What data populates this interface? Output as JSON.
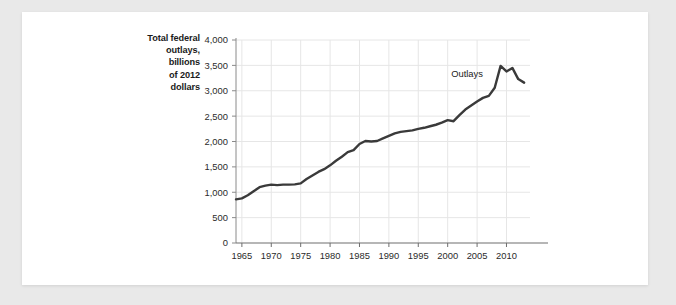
{
  "chart_data": {
    "type": "line",
    "title": "",
    "ylabel_lines": [
      "Total federal",
      "outlays,",
      "billions",
      "of 2012",
      "dollars"
    ],
    "xlabel": "",
    "ylabel": "Total federal outlays, billions of 2012 dollars",
    "xlim": [
      1964,
      2014
    ],
    "ylim": [
      0,
      4000
    ],
    "grid": true,
    "legend_position": "inline-annotation",
    "y_ticks": [
      0,
      500,
      1000,
      1500,
      2000,
      2500,
      3000,
      3500,
      4000
    ],
    "y_tick_labels": [
      "0",
      "500",
      "1,000",
      "1,500",
      "2,000",
      "2,500",
      "3,000",
      "3,500",
      "4,000"
    ],
    "x_ticks": [
      1965,
      1970,
      1975,
      1980,
      1985,
      1990,
      1995,
      2000,
      2005,
      2010
    ],
    "x_tick_labels": [
      "1965",
      "1970",
      "1975",
      "1980",
      "1985",
      "1990",
      "1995",
      "2000",
      "2005",
      "2010"
    ],
    "series": [
      {
        "name": "Outlays",
        "color": "#3a3a3a",
        "annotation": "Outlays",
        "annotation_x": 2006,
        "annotation_y": 3280,
        "x": [
          1964,
          1965,
          1966,
          1967,
          1968,
          1969,
          1970,
          1971,
          1972,
          1973,
          1974,
          1975,
          1976,
          1977,
          1978,
          1979,
          1980,
          1981,
          1982,
          1983,
          1984,
          1985,
          1986,
          1987,
          1988,
          1989,
          1990,
          1991,
          1992,
          1993,
          1994,
          1995,
          1996,
          1997,
          1998,
          1999,
          2000,
          2001,
          2002,
          2003,
          2004,
          2005,
          2006,
          2007,
          2008,
          2009,
          2010,
          2011,
          2012,
          2013
        ],
        "y": [
          860,
          880,
          940,
          1020,
          1100,
          1130,
          1150,
          1140,
          1150,
          1150,
          1155,
          1175,
          1260,
          1330,
          1400,
          1455,
          1530,
          1620,
          1700,
          1790,
          1830,
          1950,
          2010,
          2000,
          2010,
          2060,
          2110,
          2160,
          2190,
          2205,
          2220,
          2250,
          2270,
          2300,
          2330,
          2370,
          2420,
          2400,
          2520,
          2630,
          2710,
          2790,
          2860,
          2900,
          3060,
          3490,
          3380,
          3450,
          3230,
          3160
        ]
      }
    ]
  }
}
